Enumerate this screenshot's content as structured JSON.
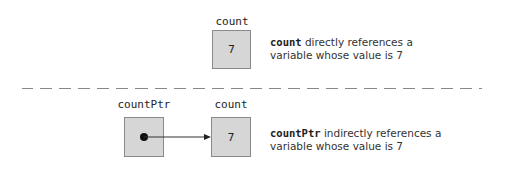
{
  "top": {
    "variable": {
      "name": "count",
      "value": "7"
    },
    "description": {
      "code": "count",
      "line1_rest": " directly references a",
      "line2": "variable whose value is 7"
    }
  },
  "bottom": {
    "pointer": {
      "name": "countPtr",
      "content": "dot"
    },
    "variable": {
      "name": "count",
      "value": "7"
    },
    "description": {
      "code": "countPtr",
      "line1_rest": " indirectly references a",
      "line2": "variable whose value is 7"
    }
  },
  "colors": {
    "box_fill": "#d6d6d6",
    "box_border": "#8a8a8a",
    "divider": "#888888",
    "text": "#333333"
  }
}
